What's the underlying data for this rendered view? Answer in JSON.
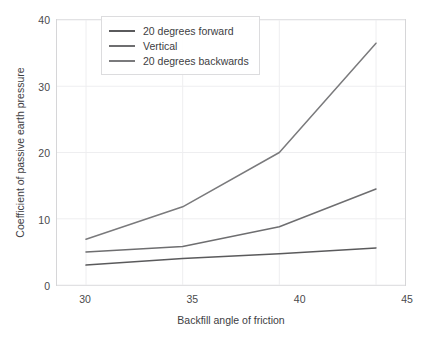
{
  "chart_data": {
    "type": "line",
    "title": "",
    "xlabel": "Backfill angle of friction",
    "ylabel": "Coefficient of passive earth pressure",
    "x": [
      30,
      35,
      40,
      45
    ],
    "xlim": [
      28.5,
      46.5
    ],
    "ylim": [
      0,
      40
    ],
    "xticks": [
      "30",
      "35",
      "40",
      "45"
    ],
    "yticks": [
      "0",
      "10",
      "20",
      "30",
      "40"
    ],
    "grid": true,
    "legend_position": "upper left",
    "series": [
      {
        "name": "20 degrees forward",
        "values": [
          3.0,
          4.0,
          4.7,
          5.6
        ],
        "color": "#5a5a5c"
      },
      {
        "name": "Vertical",
        "values": [
          5.0,
          5.8,
          8.8,
          14.5
        ],
        "color": "#6e6e70"
      },
      {
        "name": "20 degrees backwards",
        "values": [
          6.9,
          11.8,
          20.0,
          36.5
        ],
        "color": "#7a7a7c"
      }
    ]
  },
  "axes": {
    "grid_color": "#eeeef0",
    "frame_color": "#d6d6d8",
    "tick_text_color": "#4a4a4c"
  },
  "legend": {
    "items": [
      {
        "label": "20 degrees forward"
      },
      {
        "label": "Vertical"
      },
      {
        "label": "20 degrees backwards"
      }
    ]
  }
}
